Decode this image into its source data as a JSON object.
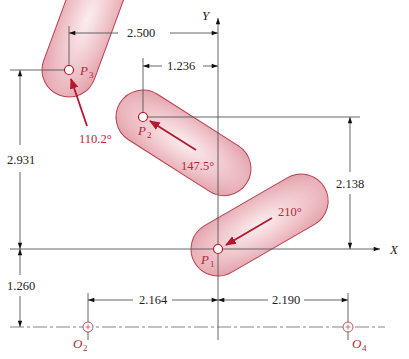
{
  "diagram": {
    "type": "three-position linkage synthesis",
    "axes": {
      "x_label": "X",
      "y_label": "Y"
    },
    "points": [
      {
        "id": "P1",
        "label": "P",
        "sub": "1",
        "angle_label": "210°"
      },
      {
        "id": "P2",
        "label": "P",
        "sub": "2",
        "angle_label": "147.5°"
      },
      {
        "id": "P3",
        "label": "P",
        "sub": "3",
        "angle_label": "110.2°"
      }
    ],
    "ground_pivots": [
      {
        "id": "O2",
        "label": "O",
        "sub": "2"
      },
      {
        "id": "O4",
        "label": "O",
        "sub": "4"
      }
    ],
    "dimensions": {
      "p3_x": "2.500",
      "p2_x": "1.236",
      "p3_y": "2.931",
      "p2_y": "2.138",
      "ground_y": "1.260",
      "o2_x": "2.164",
      "o4_x": "2.190"
    },
    "colors": {
      "slot_fill": "#e8aab2",
      "slot_stroke": "#b84050",
      "vector": "#b3182c",
      "label": "#b3283a",
      "lines": "#555555"
    }
  }
}
